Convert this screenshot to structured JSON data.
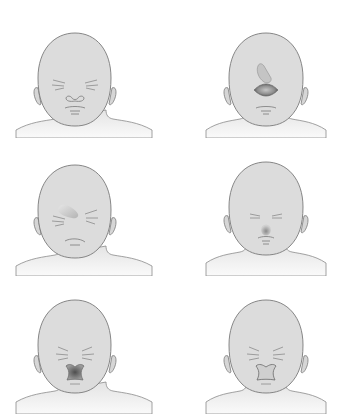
{
  "figure": {
    "layout": {
      "rows": 3,
      "cols": 2
    },
    "colors": {
      "background": "#ffffff",
      "skin": "#dcdcdc",
      "skin_light": "#e6e6e6",
      "outline": "#7a7a7a",
      "feature": "#8a8a8a",
      "defect_dark": "#5e5e5e",
      "defect_mid": "#a8a8a8",
      "defect_light": "#c8c8c8"
    },
    "panels": [
      {
        "id": "panel-1",
        "row": 1,
        "col": 1,
        "nose": "normal",
        "mouth": "normal",
        "anomaly": "none"
      },
      {
        "id": "panel-2",
        "row": 1,
        "col": 2,
        "nose": "absent",
        "mouth": "small",
        "anomaly": "midline facial cleft with proboscis above"
      },
      {
        "id": "panel-3",
        "row": 2,
        "col": 1,
        "nose": "absent",
        "mouth": "small",
        "anomaly": "lateral proboscis on forehead"
      },
      {
        "id": "panel-4",
        "row": 2,
        "col": 2,
        "nose": "single-nostril",
        "mouth": "small",
        "anomaly": "hypoplastic nose"
      },
      {
        "id": "panel-5",
        "row": 3,
        "col": 1,
        "nose": "flattened",
        "mouth": "median cleft",
        "anomaly": "median cleft lip, dark"
      },
      {
        "id": "panel-6",
        "row": 3,
        "col": 2,
        "nose": "flattened",
        "mouth": "median cleft",
        "anomaly": "median cleft lip, light"
      }
    ]
  }
}
